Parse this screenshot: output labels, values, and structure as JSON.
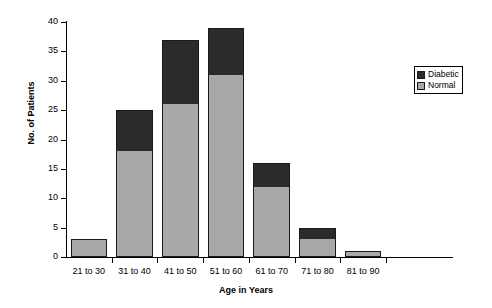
{
  "chart_data": {
    "type": "bar",
    "subtype": "stacked-bar",
    "title": "",
    "xlabel": "Age in Years",
    "ylabel": "No. of Patients",
    "categories": [
      "21 to 30",
      "31 to 40",
      "41 to 50",
      "51 to 60",
      "61 to 70",
      "71 to 80",
      "81 to 90"
    ],
    "series": [
      {
        "name": "Normal",
        "color": "#a8a8a8",
        "values": [
          3,
          18,
          26,
          31,
          12,
          3,
          1
        ]
      },
      {
        "name": "Diabetic",
        "color": "#2b2b2b",
        "values": [
          0,
          7,
          11,
          8,
          4,
          2,
          0
        ]
      }
    ],
    "totals": [
      3,
      25,
      37,
      39,
      16,
      5,
      1
    ],
    "ylim": [
      0,
      40
    ],
    "ytick_step": 5,
    "yticks": [
      0,
      5,
      10,
      15,
      20,
      25,
      30,
      35,
      40
    ],
    "ytick_labels": [
      "0",
      "5",
      "10",
      "15",
      "20",
      "25",
      "30",
      "35",
      "40"
    ],
    "grid": false,
    "legend_position": "right",
    "legend_entries": [
      "Diabetic",
      "Normal"
    ]
  },
  "legend": {
    "items": [
      {
        "label": "Diabetic",
        "color": "#2b2b2b"
      },
      {
        "label": "Normal",
        "color": "#a8a8a8"
      }
    ]
  },
  "edge_text": ""
}
